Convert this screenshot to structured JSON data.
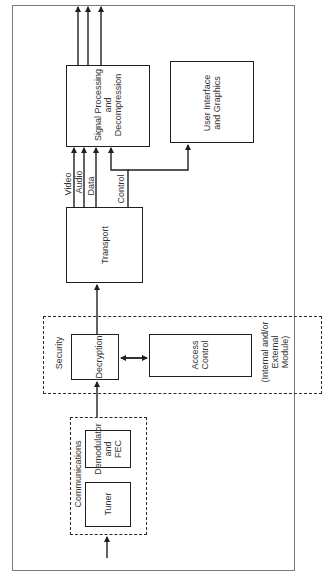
{
  "diagram": {
    "orientation": "rotated-90-ccw",
    "groups": {
      "communications": {
        "label": "Communications"
      },
      "security": {
        "label": "Security",
        "note": "(Internal and/or\nExternal\nModule)"
      }
    },
    "blocks": {
      "tuner": "Tuner",
      "demodulator": "Demodulator\nand\nFEC",
      "decryption": "Decryption",
      "access_control": "Access\nControl",
      "transport": "Transport",
      "signal_processing": "Signal Processing\nand\nDecompression",
      "user_interface": "User Interface\nand Graphics"
    },
    "signals": {
      "video": "Video",
      "audio": "Audio",
      "data": "Data",
      "control": "Control"
    },
    "connections": [
      {
        "from": "input",
        "to": "tuner"
      },
      {
        "from": "communications",
        "to": "decryption"
      },
      {
        "from": "decryption",
        "to": "access_control",
        "bidirectional": true
      },
      {
        "from": "decryption",
        "to": "transport"
      },
      {
        "from": "transport",
        "to": "signal_processing",
        "label": "Video"
      },
      {
        "from": "transport",
        "to": "signal_processing",
        "label": "Audio"
      },
      {
        "from": "transport",
        "to": "signal_processing",
        "label": "Data"
      },
      {
        "from": "transport",
        "to": "signal_processing",
        "label": "Control"
      },
      {
        "from": "transport",
        "to": "user_interface",
        "label": "Control"
      },
      {
        "from": "signal_processing",
        "to": "output",
        "count": 3
      }
    ]
  }
}
